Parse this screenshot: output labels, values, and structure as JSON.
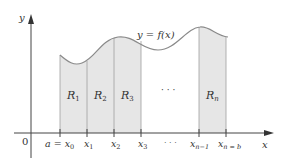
{
  "figure": {
    "curve_label": "y = f(x)",
    "y_axis_label": "y",
    "x_axis_label": "x",
    "origin_label": "0",
    "tick_labels": [
      "a = x",
      "x",
      "x",
      "x",
      "· · ·",
      "x",
      "x"
    ],
    "tick_subscripts": [
      "0",
      "1",
      "2",
      "3",
      "",
      "n−1",
      "n = b"
    ],
    "regions": [
      {
        "label": "R",
        "sub": "1"
      },
      {
        "label": "R",
        "sub": "2"
      },
      {
        "label": "R",
        "sub": "3"
      },
      {
        "label": "· · ·",
        "sub": ""
      },
      {
        "label": "R",
        "sub": "n"
      }
    ],
    "colors": {
      "region_fill": "#e6e6e6",
      "axis": "#444444",
      "curve": "#888888",
      "divider": "#999999"
    }
  }
}
